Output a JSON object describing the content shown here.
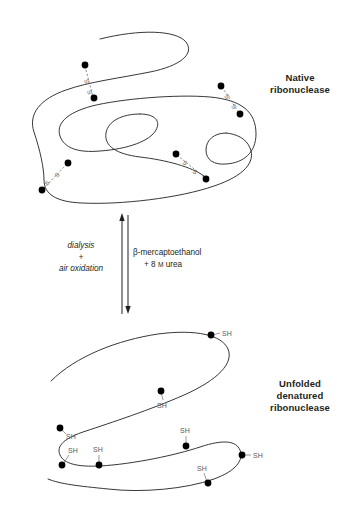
{
  "figure": {
    "background_color": "#ffffff",
    "chain_color": "#231f20",
    "residue_color": "#000000",
    "label_color": "#58595b"
  },
  "states": {
    "native": {
      "label_line1": "Native",
      "label_line2": "ribonuclease",
      "bond_label": "S",
      "bond_count": 4,
      "bonds": [
        {
          "id": "ss-1",
          "label_a": "S",
          "label_b": "S",
          "region": "upper-left"
        },
        {
          "id": "ss-2",
          "label_a": "S",
          "label_b": "S",
          "region": "upper-right"
        },
        {
          "id": "ss-3",
          "label_a": "S",
          "label_b": "S",
          "region": "lower-left"
        },
        {
          "id": "ss-4",
          "label_a": "S",
          "label_b": "S",
          "region": "lower-middle"
        }
      ]
    },
    "unfolded": {
      "label_line1": "Unfolded",
      "label_line2": "denatured",
      "label_line3": "ribonuclease",
      "thiol_label": "SH",
      "thiol_count": 8,
      "thiols": [
        {
          "id": "sh-1",
          "label": "SH",
          "region": "top-right"
        },
        {
          "id": "sh-2",
          "label": "SH",
          "region": "upper-middle"
        },
        {
          "id": "sh-3",
          "label": "SH",
          "region": "left-upper"
        },
        {
          "id": "sh-4",
          "label": "SH",
          "region": "left-lower"
        },
        {
          "id": "sh-5",
          "label": "SH",
          "region": "lower-left-mid"
        },
        {
          "id": "sh-6",
          "label": "SH",
          "region": "center"
        },
        {
          "id": "sh-7",
          "label": "SH",
          "region": "right-middle"
        },
        {
          "id": "sh-8",
          "label": "SH",
          "region": "bottom-middle"
        }
      ]
    }
  },
  "reaction": {
    "forward": {
      "line1": "dialysis",
      "line2": "+",
      "line3": "air oxidation",
      "direction": "up"
    },
    "reverse": {
      "line1": "β-mercaptoethanol",
      "line2_prefix": "+ 8 ",
      "line2_unit": "M",
      "line2_suffix": " urea",
      "direction": "down"
    }
  }
}
